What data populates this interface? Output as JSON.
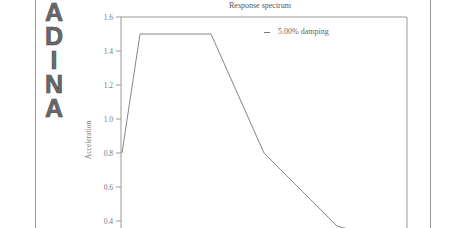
{
  "logo": {
    "letters": [
      "A",
      "D",
      "I",
      "N",
      "A"
    ]
  },
  "chart_data": {
    "type": "line",
    "title": "Response spectrum",
    "xlabel": "",
    "ylabel": "Acceleration",
    "ylim": [
      0.4,
      1.6
    ],
    "yticks": [
      "1.6",
      "1.4",
      "1.2",
      "1.0",
      "0.8",
      "0.6",
      "0.4"
    ],
    "grid": false,
    "legend_position": "top-right",
    "series": [
      {
        "name": "5.00% damping",
        "points_px_x": [
          122,
          140,
          211,
          264,
          337,
          350
        ],
        "values": [
          0.8,
          1.5,
          1.5,
          0.8,
          0.37,
          0.35
        ]
      }
    ]
  },
  "legend": {
    "label": "5.00% damping"
  }
}
